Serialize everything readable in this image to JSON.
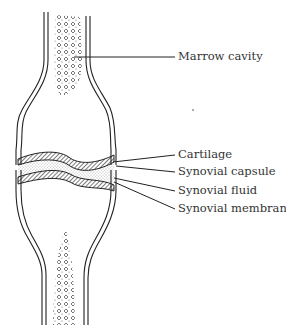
{
  "diagram": {
    "labels": [
      {
        "id": "marrow",
        "text": "Marrow cavity",
        "x": 178,
        "y": 49
      },
      {
        "id": "cartilage",
        "text": "Cartilage",
        "x": 178,
        "y": 152
      },
      {
        "id": "capsule",
        "text": "Synovial capsule",
        "x": 178,
        "y": 170
      },
      {
        "id": "fluid",
        "text": "Synovial fluid",
        "x": 178,
        "y": 189
      },
      {
        "id": "membrane",
        "text": "Synovial membrane",
        "x": 178,
        "y": 208
      }
    ],
    "colors": {
      "line": "#222222",
      "text": "#333333",
      "stipple": "#555555"
    }
  }
}
